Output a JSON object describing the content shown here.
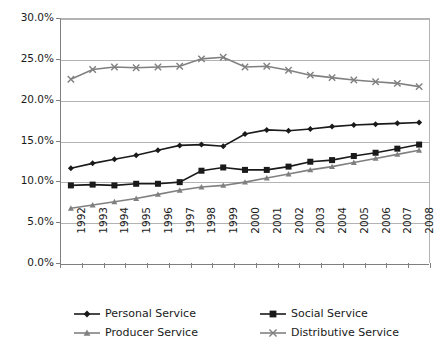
{
  "chart_data": {
    "type": "line",
    "title": "",
    "xlabel": "",
    "ylabel": "",
    "x": [
      1992,
      1993,
      1994,
      1995,
      1996,
      1997,
      1998,
      1999,
      2000,
      2001,
      2002,
      2003,
      2004,
      2005,
      2006,
      2007,
      2008
    ],
    "categories": [
      "1992",
      "1993",
      "1994",
      "1995",
      "1996",
      "1997",
      "1998",
      "1999",
      "2000",
      "2001",
      "2002",
      "2003",
      "2004",
      "2005",
      "2006",
      "2007",
      "2008"
    ],
    "ylim": [
      0,
      30
    ],
    "ytick_labels": [
      "0.0%",
      "5.0%",
      "10.0%",
      "15.0%",
      "20.0%",
      "25.0%",
      "30.0%"
    ],
    "ytick_values": [
      0,
      5,
      10,
      15,
      20,
      25,
      30
    ],
    "grid": true,
    "legend_position": "bottom",
    "series": [
      {
        "name": "Personal Service",
        "marker": "diamond",
        "color": "#1a1a1a",
        "values": [
          11.6,
          12.2,
          12.7,
          13.2,
          13.8,
          14.4,
          14.5,
          14.3,
          15.8,
          16.3,
          16.2,
          16.4,
          16.7,
          16.9,
          17.0,
          17.1,
          17.2
        ]
      },
      {
        "name": "Social Service",
        "marker": "square",
        "color": "#1a1a1a",
        "values": [
          9.5,
          9.6,
          9.5,
          9.7,
          9.7,
          9.9,
          11.3,
          11.7,
          11.4,
          11.4,
          11.8,
          12.4,
          12.6,
          13.1,
          13.5,
          14.0,
          14.5
        ]
      },
      {
        "name": "Producer Service",
        "marker": "triangle",
        "color": "#808080",
        "values": [
          6.7,
          7.1,
          7.5,
          7.9,
          8.4,
          8.9,
          9.3,
          9.5,
          9.9,
          10.4,
          10.9,
          11.4,
          11.8,
          12.3,
          12.8,
          13.3,
          13.8
        ]
      },
      {
        "name": "Distributive Service",
        "marker": "cross",
        "color": "#808080",
        "values": [
          22.5,
          23.7,
          24.0,
          23.9,
          24.0,
          24.1,
          25.0,
          25.2,
          24.0,
          24.1,
          23.6,
          23.0,
          22.7,
          22.4,
          22.2,
          22.0,
          21.6
        ]
      }
    ]
  }
}
